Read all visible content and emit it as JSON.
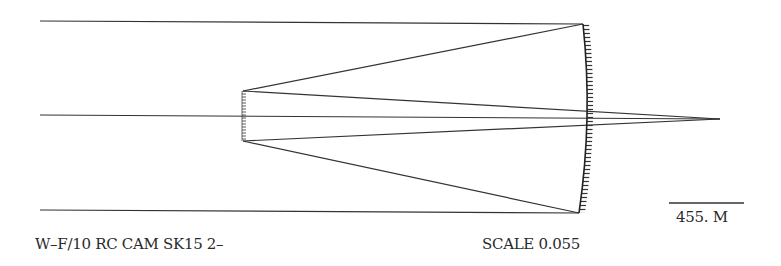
{
  "diagram": {
    "title": "W–F/10 RC CAM SK15 2–",
    "scale_text": "SCALE 0.055",
    "scale_bar_text": "455. M",
    "type": "Ritchey-Chretien telescope ray trace",
    "stroke_color": "#333333"
  }
}
